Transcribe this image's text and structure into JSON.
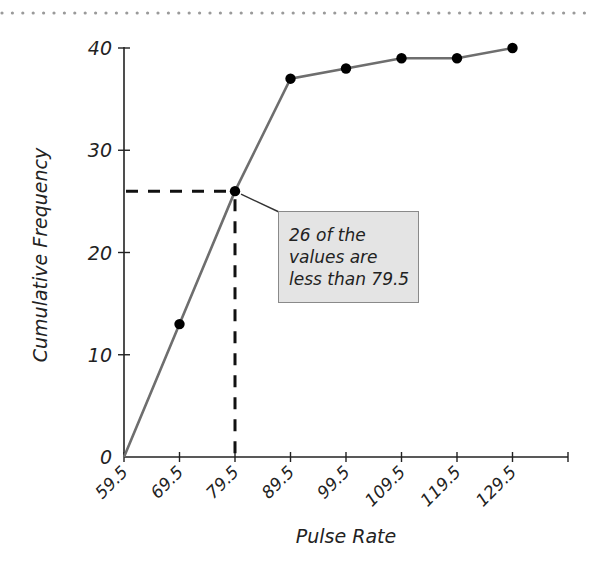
{
  "chart_data": {
    "type": "line",
    "title": "",
    "xlabel": "Pulse Rate",
    "ylabel": "Cumulative Frequency",
    "x": [
      59.5,
      69.5,
      79.5,
      89.5,
      99.5,
      109.5,
      119.5,
      129.5
    ],
    "x_tick_labels": [
      "59.5",
      "69.5",
      "79.5",
      "89.5",
      "99.5",
      "109.5",
      "119.5",
      "129.5"
    ],
    "y_tick_labels": [
      "0",
      "10",
      "20",
      "30",
      "40"
    ],
    "series": [
      {
        "name": "Cumulative Frequency",
        "values": [
          0,
          13,
          26,
          37,
          38,
          39,
          39,
          40
        ]
      }
    ],
    "ylim": [
      0,
      40
    ],
    "xlim": [
      59.5,
      139.5
    ],
    "grid": false,
    "legend": null,
    "reference_lines": {
      "x": 79.5,
      "y": 26,
      "style": "dashed"
    },
    "annotation": {
      "lines": [
        "26 of the",
        "values are",
        "less than 79.5"
      ],
      "points_to": [
        79.5,
        26
      ]
    }
  },
  "colors": {
    "line": "#6e6e6e",
    "marker": "#000000",
    "axis": "#222222",
    "callout_fill": "#e4e4e4",
    "callout_border": "#8a8a8a",
    "top_dots": "#9a9a9a"
  }
}
